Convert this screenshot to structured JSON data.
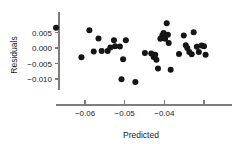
{
  "chart_data": {
    "type": "scatter",
    "title": "",
    "subtitle": "",
    "xlabel": "Predicted",
    "ylabel": "Residuals",
    "xlim": [
      -0.0685,
      -0.0285
    ],
    "ylim": [
      -0.0125,
      0.0085
    ],
    "grid": false,
    "legend": null,
    "xticks": [
      -0.06,
      -0.05,
      -0.04,
      -0.03
    ],
    "xtick_labels": [
      "−0.06",
      "−0.05",
      "−0.04",
      ""
    ],
    "yticks": [
      0.005,
      0.0,
      -0.005,
      -0.01
    ],
    "ytick_labels": [
      "0.005",
      "0.000",
      "−0.005",
      "−0.010"
    ],
    "point_color": "#151515",
    "axis_color": "#7d7d7d",
    "marker": "filled-circle",
    "marker_size": 3.0,
    "n_points": 41,
    "points": [
      {
        "x": -0.0673,
        "y": 0.0065
      },
      {
        "x": -0.0609,
        "y": -0.003
      },
      {
        "x": -0.0589,
        "y": 0.0057
      },
      {
        "x": -0.0578,
        "y": -0.0011
      },
      {
        "x": -0.0566,
        "y": 0.0031
      },
      {
        "x": -0.0558,
        "y": -0.001
      },
      {
        "x": -0.0543,
        "y": -0.001
      },
      {
        "x": -0.0536,
        "y": 0.0002
      },
      {
        "x": -0.0527,
        "y": 0.0025
      },
      {
        "x": -0.0524,
        "y": 0.0006
      },
      {
        "x": -0.0512,
        "y": 0.0005
      },
      {
        "x": -0.0508,
        "y": -0.0101
      },
      {
        "x": -0.0504,
        "y": -0.0036
      },
      {
        "x": -0.0497,
        "y": 0.0025
      },
      {
        "x": -0.0473,
        "y": -0.011
      },
      {
        "x": -0.0449,
        "y": -0.0016
      },
      {
        "x": -0.0433,
        "y": -0.0018
      },
      {
        "x": -0.0427,
        "y": -0.0029
      },
      {
        "x": -0.0423,
        "y": -0.0022
      },
      {
        "x": -0.042,
        "y": -0.0038
      },
      {
        "x": -0.0416,
        "y": -0.0066
      },
      {
        "x": -0.041,
        "y": 0.003
      },
      {
        "x": -0.0405,
        "y": 0.0041
      },
      {
        "x": -0.0402,
        "y": 0.0048
      },
      {
        "x": -0.0398,
        "y": 0.003
      },
      {
        "x": -0.0394,
        "y": 0.008
      },
      {
        "x": -0.0391,
        "y": 0.0043
      },
      {
        "x": -0.0389,
        "y": 0.0016
      },
      {
        "x": -0.0384,
        "y": -0.007
      },
      {
        "x": -0.0363,
        "y": -0.0019
      },
      {
        "x": -0.0351,
        "y": 0.004
      },
      {
        "x": -0.0346,
        "y": 0.0009
      },
      {
        "x": -0.0342,
        "y": 0.0
      },
      {
        "x": -0.0337,
        "y": -0.0013
      },
      {
        "x": -0.0331,
        "y": -0.002
      },
      {
        "x": -0.0326,
        "y": 0.0051
      },
      {
        "x": -0.0318,
        "y": 0.0004
      },
      {
        "x": -0.0313,
        "y": -0.0013
      },
      {
        "x": -0.0306,
        "y": 0.0008
      },
      {
        "x": -0.03,
        "y": 0.0006
      },
      {
        "x": -0.0296,
        "y": -0.0022
      }
    ]
  }
}
